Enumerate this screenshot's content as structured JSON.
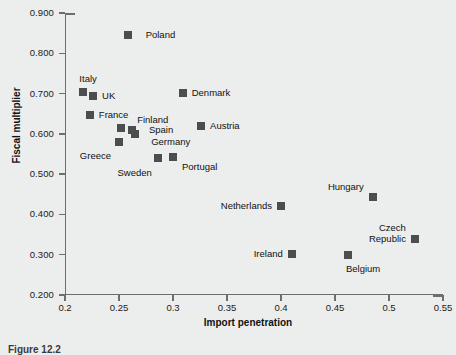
{
  "chart_data": {
    "type": "scatter",
    "title": "",
    "xlabel": "Import penetration",
    "ylabel": "Fiscal multiplier",
    "xlim": [
      0.2,
      0.55
    ],
    "ylim": [
      0.2,
      0.9
    ],
    "xticks": [
      "0.2",
      "0.25",
      "0.3",
      "0.35",
      "0.4",
      "0.45",
      "0.5",
      "0.55"
    ],
    "xtick_values": [
      0.2,
      0.25,
      0.3,
      0.35,
      0.4,
      0.45,
      0.5,
      0.55
    ],
    "yticks": [
      "0.200",
      "0.300",
      "0.400",
      "0.500",
      "0.600",
      "0.700",
      "0.800",
      "0.900"
    ],
    "ytick_values": [
      0.2,
      0.3,
      0.4,
      0.5,
      0.6,
      0.7,
      0.8,
      0.9
    ],
    "grid": false,
    "legend": "none",
    "marker_color": "#4d4d4f",
    "points": [
      {
        "label": "Poland",
        "x": 0.258,
        "y": 0.845,
        "lx": 18,
        "ly": -6,
        "align": "left"
      },
      {
        "label": "Italy",
        "x": 0.217,
        "y": 0.703,
        "lx": -4,
        "ly": -19,
        "align": "left"
      },
      {
        "label": "UK",
        "x": 0.226,
        "y": 0.695,
        "lx": 9,
        "ly": -6,
        "align": "left"
      },
      {
        "label": "France",
        "x": 0.223,
        "y": 0.648,
        "lx": 9,
        "ly": -6,
        "align": "left"
      },
      {
        "label": "Denmark",
        "x": 0.309,
        "y": 0.702,
        "lx": 9,
        "ly": -6,
        "align": "left"
      },
      {
        "label": "Austria",
        "x": 0.326,
        "y": 0.62,
        "lx": 9,
        "ly": -6,
        "align": "left"
      },
      {
        "label": "Finland",
        "x": 0.252,
        "y": 0.615,
        "lx": 16,
        "ly": -14,
        "align": "left"
      },
      {
        "label": "Spain",
        "x": 0.262,
        "y": 0.61,
        "lx": 17,
        "ly": -6,
        "align": "left"
      },
      {
        "label": "Germany",
        "x": 0.265,
        "y": 0.6,
        "lx": 16,
        "ly": 2,
        "align": "left"
      },
      {
        "label": "Greece",
        "x": 0.25,
        "y": 0.58,
        "lx": -8,
        "ly": 8,
        "align": "right"
      },
      {
        "label": "Sweden",
        "x": 0.286,
        "y": 0.54,
        "lx": -6,
        "ly": 9,
        "align": "right"
      },
      {
        "label": "Portugal",
        "x": 0.3,
        "y": 0.542,
        "lx": 9,
        "ly": 4,
        "align": "left"
      },
      {
        "label": "Netherlands",
        "x": 0.4,
        "y": 0.42,
        "lx": -9,
        "ly": -6,
        "align": "right"
      },
      {
        "label": "Hungary",
        "x": 0.485,
        "y": 0.444,
        "lx": -9,
        "ly": -16,
        "align": "right"
      },
      {
        "label": "Czech\nRepublic",
        "x": 0.524,
        "y": 0.339,
        "lx": -9,
        "ly": -17,
        "align": "right"
      },
      {
        "label": "Ireland",
        "x": 0.41,
        "y": 0.302,
        "lx": -9,
        "ly": -6,
        "align": "right"
      },
      {
        "label": "Belgium",
        "x": 0.462,
        "y": 0.299,
        "lx": -2,
        "ly": 8,
        "align": "left"
      }
    ]
  },
  "caption": "Figure 12.2"
}
